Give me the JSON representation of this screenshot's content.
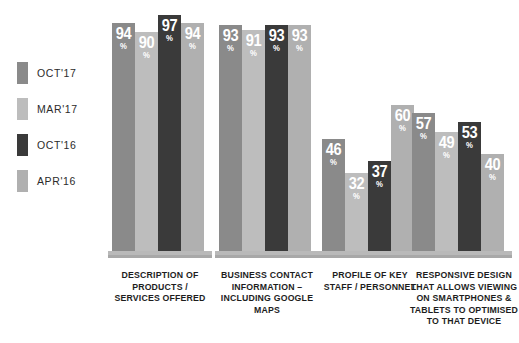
{
  "legend": {
    "items": [
      {
        "label": "OCT'17",
        "color": "#8a8a8a"
      },
      {
        "label": "MAR'17",
        "color": "#bdbdbd"
      },
      {
        "label": "OCT'16",
        "color": "#3a3a3a"
      },
      {
        "label": "APR'16",
        "color": "#b0b0b0"
      }
    ]
  },
  "chart_data": {
    "type": "bar",
    "title": "",
    "subtitle": "",
    "xlabel": "",
    "ylabel": "",
    "ylim": [
      0,
      100
    ],
    "grid": false,
    "legend_position": "left",
    "value_suffix": "%",
    "categories": [
      "DESCRIPTION OF PRODUCTS / SERVICES OFFERED",
      "BUSINESS CONTACT INFORMATION – INCLUDING GOOGLE MAPS",
      "PROFILE OF KEY STAFF / PERSONNEL",
      "RESPONSIVE DESIGN THAT ALLOWS VIEWING ON SMARTPHONES & TABLETS TO OPTIMISED TO THAT DEVICE"
    ],
    "category_lines": [
      [
        "DESCRIPTION OF",
        "PRODUCTS /",
        "SERVICES OFFERED"
      ],
      [
        "BUSINESS CONTACT",
        "INFORMATION –",
        "INCLUDING GOOGLE",
        "MAPS"
      ],
      [
        "PROFILE OF KEY",
        "STAFF / PERSONNEL"
      ],
      [
        "RESPONSIVE DESIGN",
        "THAT ALLOWS VIEWING",
        "ON SMARTPHONES &",
        "TABLETS TO OPTIMISED",
        "TO THAT DEVICE"
      ]
    ],
    "series": [
      {
        "name": "OCT'17",
        "color": "#8a8a8a",
        "values": [
          94,
          93,
          46,
          57
        ]
      },
      {
        "name": "MAR'17",
        "color": "#bdbdbd",
        "values": [
          90,
          91,
          32,
          49
        ]
      },
      {
        "name": "OCT'16",
        "color": "#3a3a3a",
        "values": [
          97,
          93,
          37,
          53
        ]
      },
      {
        "name": "APR'16",
        "color": "#b0b0b0",
        "values": [
          94,
          93,
          60,
          40
        ]
      }
    ]
  }
}
